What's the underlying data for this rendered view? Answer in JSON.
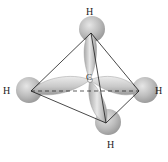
{
  "diagram": {
    "central_atom": {
      "label": "C"
    },
    "atoms": [
      {
        "id": "top",
        "label": "H"
      },
      {
        "id": "left",
        "label": "H"
      },
      {
        "id": "right",
        "label": "H"
      },
      {
        "id": "bottom",
        "label": "H"
      }
    ],
    "colors": {
      "orbital_fill": "#c8c8c8",
      "sphere_fill": "#b5b5b5",
      "edge_stroke": "#1a1a1a",
      "background": "#ffffff"
    }
  }
}
